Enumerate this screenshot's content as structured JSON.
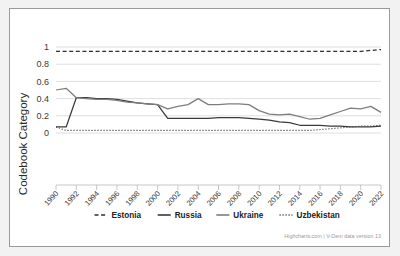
{
  "chart_data": {
    "type": "line",
    "title": "",
    "xlabel": "",
    "ylabel": "Codebook Category",
    "ylim": [
      0,
      1
    ],
    "xlim": [
      1990,
      2022
    ],
    "yticks": [
      "0",
      "0.2",
      "0.4",
      "0.6",
      "0.8",
      "1"
    ],
    "ytick_values": [
      0,
      0.2,
      0.4,
      0.6,
      0.8,
      1
    ],
    "grid": true,
    "legend_position": "bottom",
    "x": [
      1990,
      1991,
      1992,
      1993,
      1994,
      1995,
      1996,
      1997,
      1998,
      1999,
      2000,
      2001,
      2002,
      2003,
      2004,
      2005,
      2006,
      2007,
      2008,
      2009,
      2010,
      2011,
      2012,
      2013,
      2014,
      2015,
      2016,
      2017,
      2018,
      2019,
      2020,
      2021,
      2022
    ],
    "xticks": [
      "1990",
      "1992",
      "1994",
      "1996",
      "1998",
      "2000",
      "2002",
      "2004",
      "2006",
      "2008",
      "2010",
      "2012",
      "2014",
      "2016",
      "2018",
      "2020",
      "2022"
    ],
    "xtick_values": [
      1990,
      1992,
      1994,
      1996,
      1998,
      2000,
      2002,
      2004,
      2006,
      2008,
      2010,
      2012,
      2014,
      2016,
      2018,
      2020,
      2022
    ],
    "series": [
      {
        "name": "Estonia",
        "style": "dashed",
        "color": "#2f2f2f",
        "values": [
          0.95,
          0.95,
          0.95,
          0.95,
          0.95,
          0.95,
          0.95,
          0.95,
          0.95,
          0.95,
          0.95,
          0.95,
          0.95,
          0.95,
          0.95,
          0.95,
          0.95,
          0.95,
          0.95,
          0.95,
          0.95,
          0.95,
          0.95,
          0.95,
          0.95,
          0.95,
          0.95,
          0.95,
          0.95,
          0.95,
          0.95,
          0.96,
          0.97
        ]
      },
      {
        "name": "Russia",
        "style": "solid",
        "color": "#3a3a3a",
        "values": [
          0.07,
          0.07,
          0.41,
          0.41,
          0.4,
          0.4,
          0.39,
          0.37,
          0.35,
          0.34,
          0.33,
          0.17,
          0.17,
          0.17,
          0.17,
          0.17,
          0.18,
          0.18,
          0.18,
          0.17,
          0.16,
          0.15,
          0.13,
          0.12,
          0.09,
          0.09,
          0.09,
          0.08,
          0.08,
          0.07,
          0.07,
          0.07,
          0.08
        ]
      },
      {
        "name": "Ukraine",
        "style": "solid",
        "color": "#7d7d7d",
        "values": [
          0.5,
          0.52,
          0.41,
          0.4,
          0.39,
          0.39,
          0.38,
          0.36,
          0.35,
          0.34,
          0.33,
          0.28,
          0.31,
          0.33,
          0.4,
          0.33,
          0.33,
          0.34,
          0.34,
          0.33,
          0.26,
          0.22,
          0.21,
          0.22,
          0.19,
          0.16,
          0.17,
          0.21,
          0.25,
          0.29,
          0.28,
          0.31,
          0.24
        ]
      },
      {
        "name": "Uzbekistan",
        "style": "dotted",
        "color": "#4a4a4a",
        "values": [
          0.07,
          0.03,
          0.03,
          0.03,
          0.03,
          0.03,
          0.03,
          0.03,
          0.03,
          0.03,
          0.03,
          0.03,
          0.03,
          0.03,
          0.03,
          0.03,
          0.03,
          0.03,
          0.03,
          0.03,
          0.03,
          0.03,
          0.03,
          0.03,
          0.03,
          0.03,
          0.04,
          0.05,
          0.06,
          0.07,
          0.08,
          0.08,
          0.09
        ]
      }
    ]
  },
  "legend": {
    "items": [
      {
        "label": "Estonia",
        "style": "dashed",
        "color": "#2f2f2f"
      },
      {
        "label": "Russia",
        "style": "solid",
        "color": "#3a3a3a"
      },
      {
        "label": "Ukraine",
        "style": "solid",
        "color": "#7d7d7d"
      },
      {
        "label": "Uzbekistan",
        "style": "dotted",
        "color": "#4a4a4a"
      }
    ]
  },
  "credit": {
    "text": "Highcharts.com | V-Dem data version 13"
  }
}
